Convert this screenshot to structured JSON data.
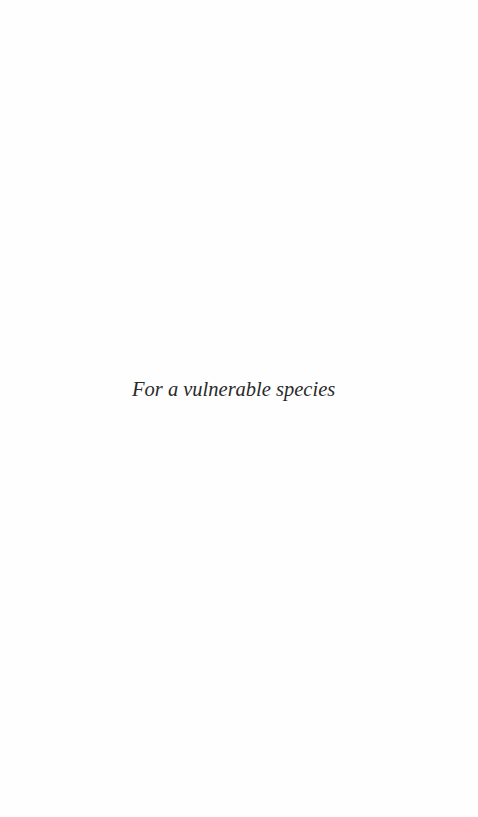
{
  "page": {
    "type": "dedication",
    "background_color": "#ffffff",
    "text_color": "#2a2a2a"
  },
  "dedication": {
    "text": "For a vulnerable species"
  }
}
